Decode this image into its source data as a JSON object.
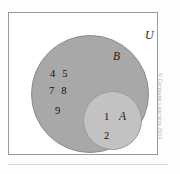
{
  "figure": {
    "type": "venn-diagram",
    "universe_label": "U",
    "sets": [
      {
        "name": "B",
        "label": "B",
        "role": "outer-circle",
        "fill_color": "#a8a8a8",
        "elements_only_in_set": [
          "4",
          "5",
          "7",
          "8",
          "9"
        ]
      },
      {
        "name": "A",
        "label": "A",
        "role": "inner-circle",
        "fill_color": "#c2c2c2",
        "elements": [
          "1",
          "2"
        ]
      }
    ],
    "element_rows": {
      "b_row_1": "4 5",
      "b_row_2": "7 8",
      "b_row_3": "9",
      "a_elem_1": "1",
      "a_elem_2": "2"
    },
    "colors": {
      "background": "#ffffff",
      "frame_border": "#9a9a9a",
      "set_b_fill": "#a8a8a8",
      "set_a_fill": "#c2c2c2",
      "text": "#101010",
      "copyright_text": "#b3b3b3",
      "bottom_rule": "#dcdcdc"
    }
  },
  "credit": {
    "text": "© Cengage Learning 2014"
  }
}
